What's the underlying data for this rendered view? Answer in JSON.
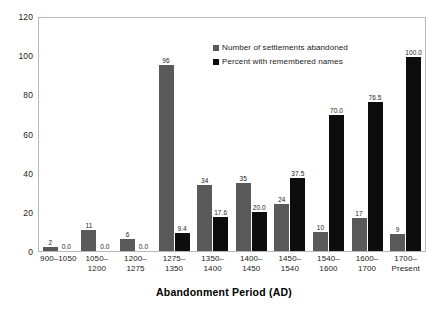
{
  "chart_data": {
    "type": "bar",
    "title": "",
    "xlabel": "Abandonment Period (AD)",
    "ylabel": "",
    "ylim": [
      0,
      120
    ],
    "yticks": [
      0,
      20,
      40,
      60,
      80,
      100,
      120
    ],
    "grid": false,
    "legend_position": "inside-top-right",
    "categories": [
      "900–1050",
      "1050–\n1200",
      "1200–\n1275",
      "1275–\n1350",
      "1350–\n1400",
      "1400–\n1450",
      "1450–\n1540",
      "1540–\n1600",
      "1600–\n1700",
      "1700–\nPresent"
    ],
    "series": [
      {
        "name": "Number of settlements abandoned",
        "color": "#595959",
        "values": [
          2,
          11,
          6,
          96,
          34,
          35,
          24,
          10,
          17,
          9
        ],
        "labels": [
          "2",
          "11",
          "6",
          "96",
          "34",
          "35",
          "24",
          "10",
          "17",
          "9"
        ]
      },
      {
        "name": "Percent with remembered names",
        "color": "#0d0d0d",
        "values": [
          0.0,
          0.0,
          0.0,
          9.4,
          17.6,
          20.0,
          37.5,
          70.0,
          76.5,
          100.0
        ],
        "labels": [
          "0.0",
          "0.0",
          "0.0",
          "9.4",
          "17.6",
          "20.0",
          "37.5",
          "70.0",
          "76.5",
          "100.0"
        ]
      }
    ]
  }
}
